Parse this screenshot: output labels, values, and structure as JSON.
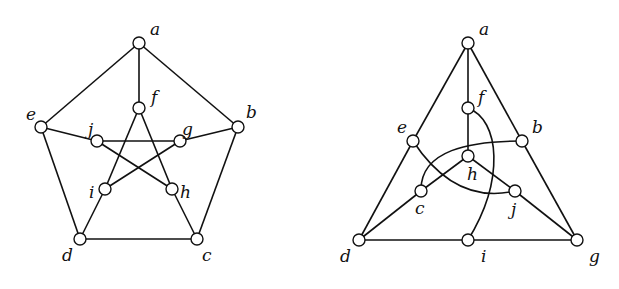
{
  "figure": {
    "left_graph": {
      "name": "petersen-pentagon-drawing",
      "nodes": [
        {
          "id": "a",
          "x": 139,
          "y": 43,
          "lx": 150,
          "ly": 35
        },
        {
          "id": "b",
          "x": 238,
          "y": 127,
          "lx": 246,
          "ly": 118
        },
        {
          "id": "c",
          "x": 197,
          "y": 239,
          "lx": 202,
          "ly": 261
        },
        {
          "id": "d",
          "x": 80,
          "y": 239,
          "lx": 62,
          "ly": 261
        },
        {
          "id": "e",
          "x": 41,
          "y": 127,
          "lx": 26,
          "ly": 120
        },
        {
          "id": "f",
          "x": 139,
          "y": 108,
          "lx": 151,
          "ly": 103
        },
        {
          "id": "g",
          "x": 180,
          "y": 141,
          "lx": 182,
          "ly": 135
        },
        {
          "id": "h",
          "x": 172,
          "y": 189,
          "lx": 180,
          "ly": 198
        },
        {
          "id": "i",
          "x": 105,
          "y": 189,
          "lx": 89,
          "ly": 198
        },
        {
          "id": "j",
          "x": 97,
          "y": 141,
          "lx": 88,
          "ly": 135
        }
      ],
      "edges": [
        [
          "a",
          "b"
        ],
        [
          "b",
          "c"
        ],
        [
          "c",
          "d"
        ],
        [
          "d",
          "e"
        ],
        [
          "e",
          "a"
        ],
        [
          "a",
          "f"
        ],
        [
          "b",
          "g"
        ],
        [
          "c",
          "h"
        ],
        [
          "d",
          "i"
        ],
        [
          "e",
          "j"
        ],
        [
          "f",
          "h"
        ],
        [
          "h",
          "j"
        ],
        [
          "j",
          "g"
        ],
        [
          "g",
          "i"
        ],
        [
          "i",
          "f"
        ]
      ]
    },
    "right_graph": {
      "name": "petersen-triangle-drawing",
      "nodes": [
        {
          "id": "a",
          "x": 468,
          "y": 43,
          "lx": 479,
          "ly": 35
        },
        {
          "id": "b",
          "x": 522,
          "y": 141,
          "lx": 532,
          "ly": 133
        },
        {
          "id": "c",
          "x": 421,
          "y": 191,
          "lx": 415,
          "ly": 214
        },
        {
          "id": "d",
          "x": 359,
          "y": 240,
          "lx": 340,
          "ly": 262
        },
        {
          "id": "e",
          "x": 413,
          "y": 141,
          "lx": 397,
          "ly": 133
        },
        {
          "id": "f",
          "x": 468,
          "y": 108,
          "lx": 478,
          "ly": 103
        },
        {
          "id": "g",
          "x": 577,
          "y": 240,
          "lx": 589,
          "ly": 262
        },
        {
          "id": "h",
          "x": 468,
          "y": 156,
          "lx": 467,
          "ly": 180
        },
        {
          "id": "i",
          "x": 468,
          "y": 240,
          "lx": 481,
          "ly": 262
        },
        {
          "id": "j",
          "x": 515,
          "y": 191,
          "lx": 511,
          "ly": 215
        }
      ],
      "edges": [
        [
          "a",
          "e"
        ],
        [
          "e",
          "d"
        ],
        [
          "a",
          "b"
        ],
        [
          "b",
          "g"
        ],
        [
          "d",
          "i"
        ],
        [
          "i",
          "g"
        ],
        [
          "a",
          "f"
        ],
        [
          "f",
          "h"
        ],
        [
          "h",
          "c"
        ],
        [
          "h",
          "j"
        ],
        [
          "c",
          "d"
        ],
        [
          "j",
          "g"
        ],
        [
          "e",
          "j",
          "curve"
        ],
        [
          "b",
          "c",
          "curve"
        ],
        [
          "f",
          "i",
          "curve"
        ]
      ]
    }
  }
}
